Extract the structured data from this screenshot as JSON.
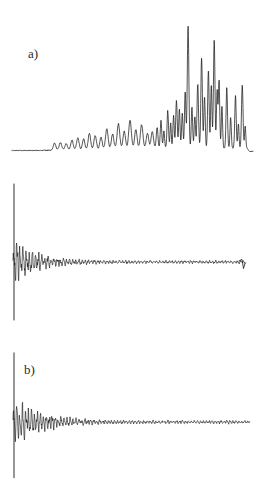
{
  "figure": {
    "title": "",
    "background_color": "#ffffff",
    "trace_color": "#1a1a1a",
    "label_color": "#2b2b2b",
    "width": 263,
    "height": 487
  },
  "panels": [
    {
      "id": "a",
      "label": "a)",
      "label_x": 28,
      "label_y": 46
    },
    {
      "id": "b",
      "label": "b)",
      "label_x": 24,
      "label_y": 192
    },
    {
      "id": "c",
      "label": "c)",
      "label_x": 24,
      "label_y": 347
    }
  ],
  "chart_data": [
    {
      "type": "line",
      "id": "a",
      "title": "",
      "subtitle": "",
      "annotation": "a)",
      "xlabel": "",
      "ylabel": "",
      "grid": false,
      "legend": "none",
      "axes_visible": false,
      "description": "Spectrum-like trace: flat noisy baseline on the left rising into a dense cluster of sharp peaks on the right, then decaying to a flat tail.",
      "xlim": [
        0,
        240
      ],
      "ylim": [
        0,
        1
      ],
      "baseline": 0.03,
      "x": [
        0,
        2,
        4,
        6,
        8,
        10,
        12,
        14,
        16,
        18,
        20,
        22,
        24,
        26,
        28,
        30,
        32,
        34,
        36,
        38,
        40,
        42,
        44,
        46,
        48,
        50,
        52,
        54,
        56,
        58,
        60,
        62,
        64,
        66,
        68,
        70,
        72,
        74,
        76,
        78,
        80,
        82,
        84,
        86,
        88,
        90,
        92,
        94,
        96,
        98,
        100,
        102,
        104,
        106,
        108,
        110,
        112,
        114,
        116,
        118,
        120,
        122,
        124,
        126,
        128,
        130,
        132,
        134,
        136,
        138,
        140,
        142,
        144,
        146,
        148,
        150,
        152,
        154,
        156,
        158,
        160,
        162,
        164,
        166,
        168,
        170,
        172,
        174,
        176,
        178,
        180,
        182,
        184,
        186,
        188,
        190,
        192,
        194,
        196,
        198,
        200,
        202,
        204,
        206,
        208,
        210,
        212,
        214,
        216,
        218,
        220,
        222,
        224,
        226,
        228,
        230,
        232,
        234,
        236,
        238,
        240
      ],
      "values": [
        0.03,
        0.032,
        0.03,
        0.034,
        0.031,
        0.036,
        0.032,
        0.038,
        0.033,
        0.035,
        0.031,
        0.034,
        0.032,
        0.036,
        0.033,
        0.04,
        0.034,
        0.038,
        0.033,
        0.036,
        0.034,
        0.045,
        0.038,
        0.042,
        0.036,
        0.04,
        0.037,
        0.055,
        0.044,
        0.05,
        0.04,
        0.048,
        0.042,
        0.075,
        0.055,
        0.065,
        0.048,
        0.12,
        0.07,
        0.09,
        0.055,
        0.14,
        0.08,
        0.1,
        0.06,
        0.155,
        0.085,
        0.105,
        0.065,
        0.12,
        0.075,
        0.17,
        0.095,
        0.13,
        0.08,
        0.19,
        0.11,
        0.14,
        0.085,
        0.23,
        0.13,
        0.16,
        0.095,
        0.18,
        0.11,
        0.16,
        0.1,
        0.24,
        0.14,
        0.3,
        0.17,
        0.22,
        0.13,
        0.25,
        0.15,
        0.21,
        0.13,
        0.28,
        0.165,
        0.32,
        0.19,
        0.35,
        0.2,
        0.3,
        0.18,
        0.26,
        0.16,
        0.33,
        0.195,
        0.29,
        0.175,
        0.24,
        0.15,
        0.2,
        0.13,
        0.175,
        0.12,
        0.155,
        0.11,
        0.145,
        0.105,
        0.16,
        0.115,
        0.19,
        0.13,
        0.29,
        0.18,
        0.42,
        0.25,
        0.38,
        0.22,
        0.34,
        0.2,
        0.33,
        0.21,
        0.4,
        0.25,
        0.48,
        0.3
      ],
      "peaks": [
        {
          "x": 182,
          "height": 1.0,
          "label": "tallest-peak"
        },
        {
          "x": 196,
          "height": 0.74
        },
        {
          "x": 203,
          "height": 0.63
        },
        {
          "x": 209,
          "height": 0.88
        },
        {
          "x": 214,
          "height": 0.55
        },
        {
          "x": 222,
          "height": 0.49
        },
        {
          "x": 231,
          "height": 0.42
        },
        {
          "x": 238,
          "height": 0.52
        }
      ]
    },
    {
      "type": "line",
      "id": "b",
      "title": "",
      "subtitle": "",
      "annotation": "b)",
      "xlabel": "",
      "ylabel": "",
      "grid": false,
      "legend": "none",
      "axes_visible": false,
      "description": "Interferogram / damped oscillating signal. A very tall narrow centerburst spike at the left edge, followed by rapidly decaying high-frequency oscillations about a flat midline, ending with a small downward drop at the right edge.",
      "xlim": [
        0,
        240
      ],
      "ylim": [
        -1,
        1
      ],
      "midline": 0.0,
      "centerburst_x": 5,
      "centerburst_amplitude": 1.0,
      "decay_constant": 22,
      "oscillation_period": 3.2,
      "tail_amplitude": 0.045,
      "end_drop": -0.22,
      "end_drop_x": 236
    },
    {
      "type": "line",
      "id": "c",
      "title": "",
      "subtitle": "",
      "annotation": "c)",
      "xlabel": "",
      "ylabel": "",
      "grid": false,
      "legend": "none",
      "axes_visible": false,
      "description": "Interferogram / damped oscillating signal similar to b) but with slightly slower decay, a marginally lower centerburst and a flat ending with no terminal drop.",
      "xlim": [
        0,
        240
      ],
      "ylim": [
        -1,
        1
      ],
      "midline": 0.0,
      "centerburst_x": 5,
      "centerburst_amplitude": 0.96,
      "decay_constant": 26,
      "oscillation_period": 3.0,
      "tail_amplitude": 0.05,
      "end_drop": 0.0,
      "end_drop_x": 240
    }
  ]
}
